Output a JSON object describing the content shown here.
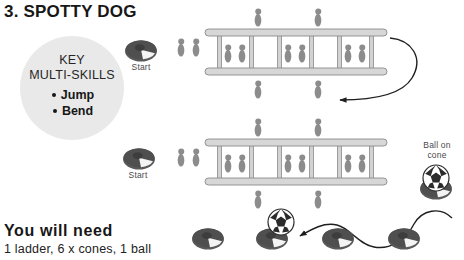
{
  "page": {
    "title": "3. SPOTTY DOG",
    "background_color": "#ffffff"
  },
  "key_panel": {
    "heading_line_1": "KEY",
    "heading_line_2": "MULTI-SKILLS",
    "circle_color": "#e9e9e9",
    "skills": [
      {
        "label": "Jump"
      },
      {
        "label": "Bend"
      }
    ]
  },
  "equipment": {
    "heading": "You will need",
    "list": "1 ladder, 6 x cones, 1 ball"
  },
  "diagram": {
    "colors": {
      "cone_dark": "#555555",
      "cone_light": "#f2f2f2",
      "footprint": "#8c8c8c",
      "ladder_fill": "#d2d2d2",
      "ladder_stroke": "#8a8a8a",
      "arrow": "#1f1f1f",
      "ball_white": "#ffffff",
      "ball_black": "#2b2b2b"
    },
    "labels": {
      "start_top": "Start",
      "start_bottom": "Start",
      "ball_on_cone_line_1": "Ball on",
      "ball_on_cone_line_2": "cone"
    },
    "rows": [
      {
        "name": "ladder-row-top",
        "start_cone": true,
        "footprint_pairs": 3,
        "single_footprints_above": 2,
        "single_footprints_below": 2,
        "return_arrow": true
      },
      {
        "name": "ladder-row-bottom",
        "start_cone": true,
        "footprint_pairs": 3,
        "single_footprints_above": 2,
        "single_footprints_below": 2,
        "ball_on_cone": true
      },
      {
        "name": "slalom-row",
        "cones": 4,
        "ball": true,
        "weave_path": true
      }
    ]
  }
}
